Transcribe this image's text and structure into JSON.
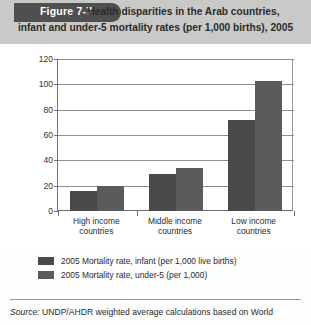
{
  "figure": {
    "tab_label": "Figure 7-7",
    "title_line1": "Health disparities in the Arab countries,",
    "title_line2": "infant and under-5 mortality rates (per 1,000 births), 2005",
    "source_prefix": "Source:",
    "source_text": "UNDP/AHDR weighted average calculations based on World"
  },
  "colors": {
    "header_band": "#c9c9c7",
    "figure_tab": "#4f4f4f",
    "series_infant": "#4a4a4a",
    "series_under5": "#5b5b5b",
    "axis": "#6f6f6f",
    "gridline": "#8d8d8d"
  },
  "chart_data": {
    "type": "bar",
    "title": "Health disparities in the Arab countries, infant and under-5 mortality rates (per 1,000 births), 2005",
    "xlabel": "",
    "ylabel": "",
    "ylim": [
      0,
      120
    ],
    "yticks": [
      0,
      20,
      40,
      60,
      80,
      100,
      120
    ],
    "grid": true,
    "legend_position": "bottom-left",
    "categories": [
      "High income countries",
      "Middle income countries",
      "Low income countries"
    ],
    "category_lines": [
      [
        "High income",
        "countries"
      ],
      [
        "Middle income",
        "countries"
      ],
      [
        "Low income",
        "countries"
      ]
    ],
    "series": [
      {
        "name": "2005 Mortality rate, infant (per 1,000 live births)",
        "values": [
          16,
          29,
          72
        ]
      },
      {
        "name": "2005 Mortality rate, under-5 (per 1,000)",
        "values": [
          20,
          34,
          103
        ]
      }
    ]
  }
}
